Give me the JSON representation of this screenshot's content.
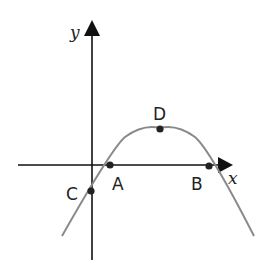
{
  "diagram": {
    "type": "parabola-graph",
    "axes": {
      "x_label": "x",
      "y_label": "y",
      "origin": [
        92,
        165
      ],
      "x_axis": {
        "from": 18,
        "to": 232
      },
      "y_axis": {
        "from": 20,
        "to": 260
      }
    },
    "curve": {
      "color": "#8a8a8a",
      "description": "downward-opening parabola",
      "start": [
        62,
        236
      ],
      "vertex": [
        160,
        129
      ],
      "end": [
        254,
        236
      ]
    },
    "points": [
      {
        "label": "A",
        "x": 110,
        "y": 165,
        "label_x": 113,
        "label_y": 190,
        "meaning": "left x-intercept"
      },
      {
        "label": "B",
        "x": 209,
        "y": 166,
        "label_x": 190,
        "label_y": 190,
        "meaning": "right x-intercept"
      },
      {
        "label": "C",
        "x": 91,
        "y": 191,
        "label_x": 66,
        "label_y": 200,
        "meaning": "y-intercept"
      },
      {
        "label": "D",
        "x": 160,
        "y": 129,
        "label_x": 153,
        "label_y": 119,
        "meaning": "vertex (maximum)"
      }
    ]
  }
}
